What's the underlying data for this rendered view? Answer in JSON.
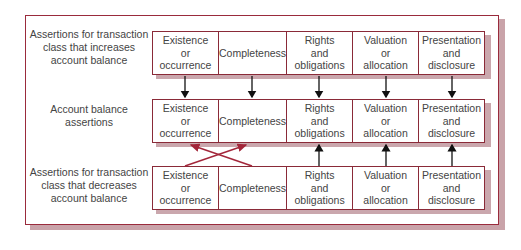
{
  "diagram": {
    "rows": [
      {
        "label": "Assertions for transaction\nclass that increases\naccount balance",
        "cells": [
          "Existence\nor\noccurrence",
          "Completeness",
          "Rights\nand\nobligations",
          "Valuation\nor\nallocation",
          "Presentation\nand\ndisclosure"
        ]
      },
      {
        "label": "Account balance\nassertions",
        "cells": [
          "Existence\nor\noccurrence",
          "Completeness",
          "Rights\nand\nobligations",
          "Valuation\nor\nallocation",
          "Presentation\nand\ndisclosure"
        ]
      },
      {
        "label": "Assertions for transaction\nclass that decreases\naccount balance",
        "cells": [
          "Existence\nor\noccurrence",
          "Completeness",
          "Rights\nand\nobligations",
          "Valuation\nor\nallocation",
          "Presentation\nand\ndisclosure"
        ]
      }
    ],
    "connections": {
      "increases_to_balance": "straight down arrows for all five assertions",
      "decreases_to_balance": "crossed arrows for Existence/Completeness; straight up arrows for Rights, Valuation, Presentation"
    },
    "colors": {
      "border": "#8a2a38",
      "frame": "#9a2b3c",
      "shadow": "#caa7ad",
      "arrow_black": "#111111",
      "arrow_red": "#a3263a"
    }
  }
}
